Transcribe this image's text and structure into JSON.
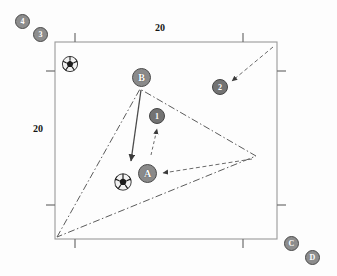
{
  "figure": {
    "type": "scatter-diagram",
    "background": "#fdfdfd",
    "frame": {
      "x": 55,
      "y": 42,
      "width": 222,
      "height": 197,
      "stroke": "#9a9a9a"
    },
    "axis_labels": {
      "top": "20",
      "left": "20"
    },
    "colors": {
      "node_fill": "#8a8a8a",
      "node_stroke": "#4a4a4a",
      "node_text": "#ffffff",
      "frame_stroke": "#9a9a9a",
      "line_stroke": "#555555",
      "label_text": "#151515"
    },
    "nodes": [
      {
        "id": "n4",
        "label": "4",
        "x": 23,
        "y": 22,
        "kind": "outside"
      },
      {
        "id": "n3",
        "label": "3",
        "x": 41,
        "y": 35,
        "kind": "outside"
      },
      {
        "id": "nB",
        "label": "B",
        "x": 142,
        "y": 78,
        "kind": "big"
      },
      {
        "id": "n2",
        "label": "2",
        "x": 220,
        "y": 87,
        "kind": "small"
      },
      {
        "id": "n1",
        "label": "1",
        "x": 157,
        "y": 116,
        "kind": "small"
      },
      {
        "id": "nA",
        "label": "A",
        "x": 148,
        "y": 174,
        "kind": "big"
      },
      {
        "id": "nC",
        "label": "C",
        "x": 292,
        "y": 244,
        "kind": "outside"
      },
      {
        "id": "nD",
        "label": "D",
        "x": 313,
        "y": 258,
        "kind": "outside"
      }
    ],
    "balls": [
      {
        "id": "ball-top-left",
        "x": 70,
        "y": 64
      },
      {
        "id": "ball-center",
        "x": 123,
        "y": 182
      }
    ],
    "triangle": {
      "style": "dash-dot",
      "vertices": [
        {
          "x": 57,
          "y": 237
        },
        {
          "x": 140,
          "y": 89
        },
        {
          "x": 256,
          "y": 156
        }
      ]
    },
    "arrows": [
      {
        "id": "arrow-b-to-ball",
        "style": "solid",
        "x1": 141,
        "y1": 90,
        "x2": 131,
        "y2": 162
      },
      {
        "id": "arrow-to-node-1",
        "style": "dashed",
        "x1": 152,
        "y1": 155,
        "x2": 157,
        "y2": 128
      },
      {
        "id": "arrow-to-node-a",
        "style": "dashed",
        "x1": 253,
        "y1": 159,
        "x2": 162,
        "y2": 173
      },
      {
        "id": "arrow-to-node-2",
        "style": "dashed",
        "x1": 272,
        "y1": 48,
        "x2": 231,
        "y2": 81
      }
    ],
    "ticks": {
      "top": [
        75,
        243
      ],
      "bottom": [
        75,
        243
      ],
      "left": [
        71,
        205
      ],
      "right": [
        71,
        205
      ],
      "length": 9
    }
  }
}
